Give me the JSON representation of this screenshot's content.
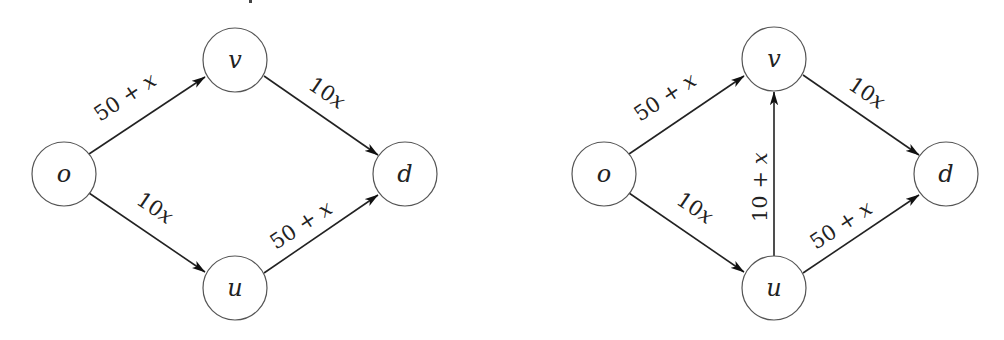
{
  "diagrams": [
    {
      "id": "left",
      "nodes": [
        {
          "id": "o",
          "label": "o",
          "cx": 64,
          "cy": 174
        },
        {
          "id": "v",
          "label": "v",
          "cx": 235,
          "cy": 60
        },
        {
          "id": "u",
          "label": "u",
          "cx": 235,
          "cy": 288
        },
        {
          "id": "d",
          "label": "d",
          "cx": 405,
          "cy": 174
        }
      ],
      "edges": [
        {
          "from": "o",
          "to": "v",
          "cost": "50 + x",
          "num": "50 + ",
          "var": "x"
        },
        {
          "from": "v",
          "to": "d",
          "cost": "10x",
          "num": "10",
          "var": "x"
        },
        {
          "from": "o",
          "to": "u",
          "cost": "10x",
          "num": "10",
          "var": "x"
        },
        {
          "from": "u",
          "to": "d",
          "cost": "50 + x",
          "num": "50 + ",
          "var": "x"
        }
      ]
    },
    {
      "id": "right",
      "nodes": [
        {
          "id": "o",
          "label": "o",
          "cx": 604,
          "cy": 174
        },
        {
          "id": "v",
          "label": "v",
          "cx": 774,
          "cy": 59
        },
        {
          "id": "u",
          "label": "u",
          "cx": 774,
          "cy": 288
        },
        {
          "id": "d",
          "label": "d",
          "cx": 946,
          "cy": 174
        }
      ],
      "edges": [
        {
          "from": "o",
          "to": "v",
          "cost": "50 + x",
          "num": "50 + ",
          "var": "x"
        },
        {
          "from": "v",
          "to": "d",
          "cost": "10x",
          "num": "10",
          "var": "x"
        },
        {
          "from": "o",
          "to": "u",
          "cost": "10x",
          "num": "10",
          "var": "x"
        },
        {
          "from": "u",
          "to": "v",
          "cost": "10 + x",
          "num": "10 + ",
          "var": "x"
        },
        {
          "from": "u",
          "to": "d",
          "cost": "50 + x",
          "num": "50 + ",
          "var": "x"
        }
      ]
    }
  ]
}
